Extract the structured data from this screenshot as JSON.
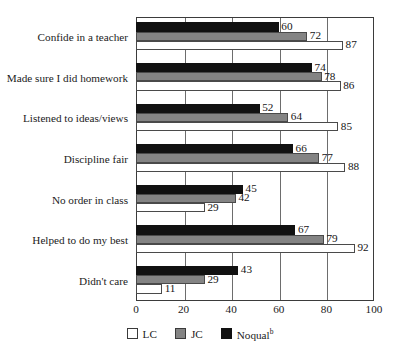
{
  "chart_data": {
    "type": "bar",
    "orientation": "horizontal",
    "title": "",
    "xlabel": "",
    "ylabel": "",
    "xlim": [
      0,
      100
    ],
    "xticks": [
      "0",
      "20",
      "40",
      "60",
      "80",
      "100"
    ],
    "grid": true,
    "legend_position": "bottom",
    "categories": [
      "Confide in a teacher",
      "Made sure I did homework",
      "Listened to ideas/views",
      "Discipline fair",
      "No order in class",
      "Helped to do my best",
      "Didn't care"
    ],
    "series": [
      {
        "name": "LC",
        "color": "#ffffff",
        "values": [
          87,
          86,
          85,
          88,
          29,
          92,
          11
        ]
      },
      {
        "name": "JC",
        "color": "#848484",
        "values": [
          72,
          78,
          64,
          77,
          42,
          79,
          29
        ]
      },
      {
        "name": "Noqual",
        "color": "#111111",
        "values": [
          60,
          74,
          52,
          66,
          45,
          67,
          43
        ]
      }
    ]
  },
  "legend": {
    "items": [
      {
        "label": "LC",
        "sup": "",
        "swatch": "lc"
      },
      {
        "label": "JC",
        "sup": "",
        "swatch": "jc"
      },
      {
        "label": "Noqual",
        "sup": "b",
        "swatch": "noqual"
      }
    ]
  }
}
